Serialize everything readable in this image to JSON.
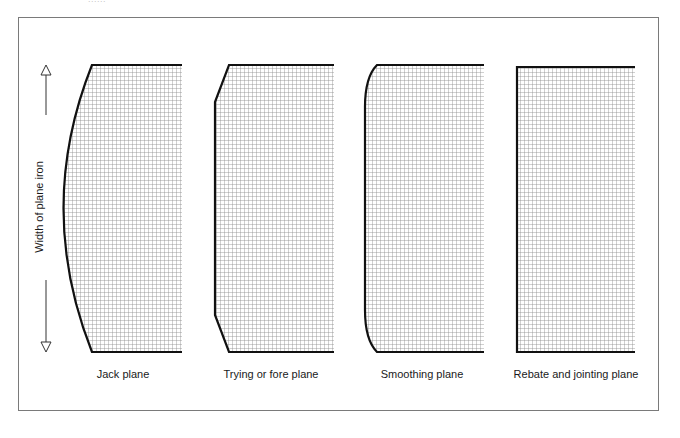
{
  "figure": {
    "top_fragment_text": "......",
    "axis_label": "Width of plane iron",
    "colors": {
      "outline": "#111111",
      "grid": "#8a8a8a",
      "frame": "#7a7a7a",
      "text": "#1a1a1a"
    },
    "panels": [
      {
        "id": "jack",
        "caption": "Jack plane",
        "edge_shape": "strongly-curved"
      },
      {
        "id": "trying",
        "caption": "Trying or fore plane",
        "edge_shape": "straight-with-chamfered-corners"
      },
      {
        "id": "smoothing",
        "caption": "Smoothing plane",
        "edge_shape": "straight-with-rounded-corners"
      },
      {
        "id": "rebate",
        "caption": "Rebate and jointing plane",
        "edge_shape": "square"
      }
    ]
  }
}
